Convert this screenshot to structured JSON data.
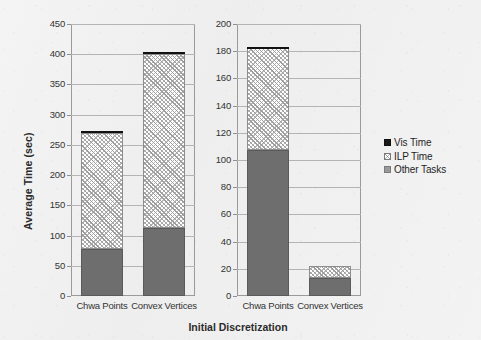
{
  "figure": {
    "xlabel": "Initial Discretization",
    "ylabel": "Average Time (sec)"
  },
  "legend": {
    "items": [
      {
        "label": "Vis Time",
        "swatch": "solid-black-square-icon",
        "color": "#1a1a1a"
      },
      {
        "label": "ILP Time",
        "swatch": "hatched-square-icon",
        "color": "#b0b0b0"
      },
      {
        "label": "Other Tasks",
        "swatch": "gray-square-icon",
        "color": "#6e6e6e"
      }
    ]
  },
  "chart_data": [
    {
      "type": "bar",
      "id": "left-panel",
      "stacked": true,
      "title": "",
      "xlabel": "Initial Discretization",
      "ylabel": "Average Time (sec)",
      "categories": [
        "Chwa Points",
        "Convex Vertices"
      ],
      "ylim": [
        0,
        450
      ],
      "yticks": [
        0,
        50,
        100,
        150,
        200,
        250,
        300,
        350,
        400,
        450
      ],
      "ytick_labels": [
        "0",
        "50",
        "100",
        "150",
        "200",
        "250",
        "300",
        "350",
        "400",
        "450"
      ],
      "grid": true,
      "legend_position": "right-outside",
      "series": [
        {
          "name": "Other Tasks",
          "values": [
            78,
            112
          ]
        },
        {
          "name": "ILP Time",
          "values": [
            192,
            288
          ]
        },
        {
          "name": "Vis Time",
          "values": [
            3,
            3
          ]
        }
      ],
      "totals": [
        273,
        403
      ]
    },
    {
      "type": "bar",
      "id": "right-panel",
      "stacked": true,
      "title": "",
      "xlabel": "Initial Discretization",
      "ylabel": "",
      "categories": [
        "Chwa Points",
        "Convex Vertices"
      ],
      "ylim": [
        0,
        200
      ],
      "yticks": [
        0,
        20,
        40,
        60,
        80,
        100,
        120,
        140,
        160,
        180,
        200
      ],
      "ytick_labels": [
        "0",
        "20",
        "40",
        "60",
        "80",
        "100",
        "120",
        "140",
        "160",
        "180",
        "200"
      ],
      "grid": true,
      "legend_position": "right-outside",
      "series": [
        {
          "name": "Other Tasks",
          "values": [
            107,
            13
          ]
        },
        {
          "name": "ILP Time",
          "values": [
            75,
            9
          ]
        },
        {
          "name": "Vis Time",
          "values": [
            1,
            0
          ]
        }
      ],
      "totals": [
        183,
        22
      ]
    }
  ]
}
